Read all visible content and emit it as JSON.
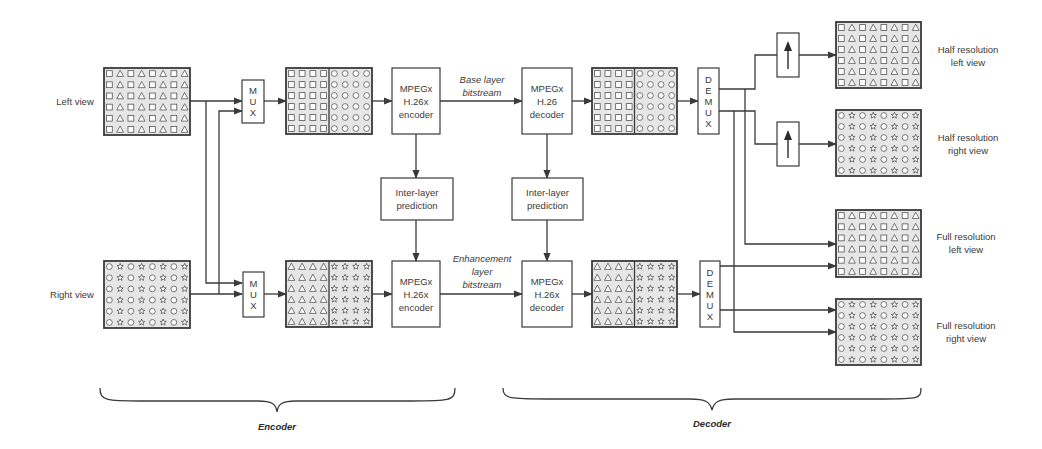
{
  "diagram": {
    "colors": {
      "line": "#3a3a3a",
      "grid_fill": "#e6e6e6",
      "box_fill": "#ffffff"
    },
    "inputs": {
      "left_view": "Left view",
      "right_view": "Right view"
    },
    "mux": {
      "letters": [
        "M",
        "U",
        "X"
      ]
    },
    "demux": {
      "letters": [
        "D",
        "E",
        "M",
        "U",
        "X"
      ]
    },
    "encoder_top": [
      "MPEGx",
      "H.26x",
      "encoder"
    ],
    "encoder_bottom": [
      "MPEGx",
      "H.26x",
      "encoder"
    ],
    "decoder_top": [
      "MPEGx",
      "H.26",
      "decoder"
    ],
    "decoder_bottom": [
      "MPEGx",
      "H.26x",
      "decoder"
    ],
    "inter_layer_encoder": [
      "Inter-layer",
      "prediction"
    ],
    "inter_layer_decoder": [
      "Inter-layer",
      "prediction"
    ],
    "base_layer": [
      "Base layer",
      "bitstream"
    ],
    "enhancement_layer": [
      "Enhancement",
      "layer",
      "bitstream"
    ],
    "outputs": {
      "half_left": [
        "Half resolution",
        "left view"
      ],
      "half_right": [
        "Half resolution",
        "right view"
      ],
      "full_left": [
        "Full resolution",
        "left view"
      ],
      "full_right": [
        "Full resolution",
        "right view"
      ]
    },
    "sections": {
      "encoder": "Encoder",
      "decoder": "Decoder"
    },
    "grid_patterns": {
      "left": "square-triangle",
      "right": "circle-star",
      "packed_base": "squares|circles",
      "packed_enh": "triangles|stars"
    },
    "upsample_icon": "arrow-up-icon"
  }
}
